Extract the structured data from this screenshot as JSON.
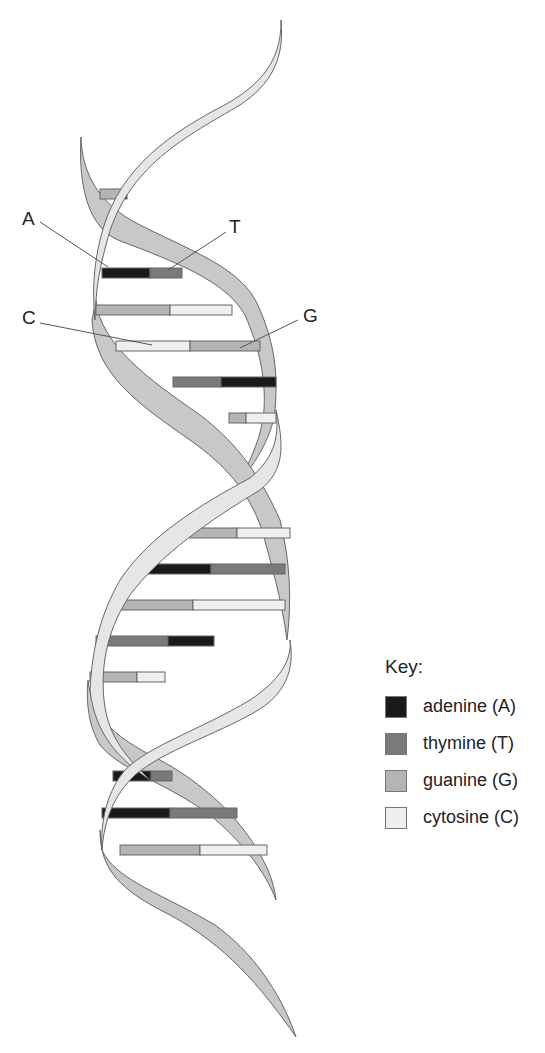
{
  "labels": {
    "A": {
      "text": "A",
      "x": 22,
      "y": 213,
      "lx1": 40,
      "ly1": 222,
      "lx2": 108,
      "ly2": 267
    },
    "T": {
      "text": "T",
      "x": 230,
      "y": 220,
      "lx1": 226,
      "ly1": 232,
      "lx2": 168,
      "ly2": 270
    },
    "C": {
      "text": "C",
      "x": 22,
      "y": 313,
      "lx1": 40,
      "ly1": 323,
      "lx2": 152,
      "ly2": 345
    },
    "G": {
      "text": "G",
      "x": 304,
      "y": 310,
      "lx1": 298,
      "ly1": 320,
      "lx2": 240,
      "ly2": 348
    }
  },
  "key": {
    "title": "Key:",
    "items": [
      {
        "label": "adenine (A)",
        "color": "#1a1a1a"
      },
      {
        "label": "thymine (T)",
        "color": "#7a7a7a"
      },
      {
        "label": "guanine (G)",
        "color": "#b4b4b4"
      },
      {
        "label": "cytosine (C)",
        "color": "#efefef"
      }
    ]
  },
  "colors": {
    "A": "#1a1a1a",
    "T": "#7a7a7a",
    "G": "#b4b4b4",
    "C": "#efefef",
    "strand_back": "#c8c8c8",
    "strand_front": "#e6e6e6",
    "outline": "#666666"
  },
  "base_pairs": [
    {
      "y": 189,
      "x1": 100,
      "mid": 122,
      "x2": 127,
      "left": "G",
      "right": "A"
    },
    {
      "y": 268,
      "x1": 102,
      "mid": 150,
      "x2": 182,
      "left": "A",
      "right": "T"
    },
    {
      "y": 305,
      "x1": 96,
      "mid": 170,
      "x2": 232,
      "left": "G",
      "right": "C"
    },
    {
      "y": 341,
      "x1": 116,
      "mid": 190,
      "x2": 260,
      "left": "C",
      "right": "G"
    },
    {
      "y": 377,
      "x1": 173,
      "mid": 221,
      "x2": 276,
      "left": "T",
      "right": "A"
    },
    {
      "y": 413,
      "x1": 229,
      "mid": 246,
      "x2": 276,
      "left": "G",
      "right": "C"
    },
    {
      "y": 528,
      "x1": 190,
      "mid": 237,
      "x2": 290,
      "left": "G",
      "right": "C"
    },
    {
      "y": 564,
      "x1": 145,
      "mid": 211,
      "x2": 285,
      "left": "A",
      "right": "T"
    },
    {
      "y": 600,
      "x1": 115,
      "mid": 193,
      "x2": 285,
      "left": "G",
      "right": "C"
    },
    {
      "y": 636,
      "x1": 96,
      "mid": 168,
      "x2": 214,
      "left": "T",
      "right": "A"
    },
    {
      "y": 672,
      "x1": 90,
      "mid": 137,
      "x2": 165,
      "left": "G",
      "right": "C"
    },
    {
      "y": 771,
      "x1": 113,
      "mid": 151,
      "x2": 172,
      "left": "A",
      "right": "T"
    },
    {
      "y": 808,
      "x1": 102,
      "mid": 170,
      "x2": 237,
      "left": "A",
      "right": "T"
    },
    {
      "y": 845,
      "x1": 120,
      "mid": 200,
      "x2": 267,
      "left": "G",
      "right": "C"
    }
  ]
}
